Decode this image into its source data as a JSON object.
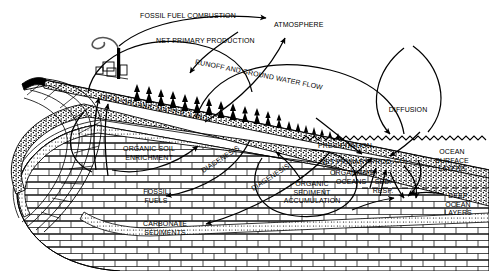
{
  "diagram": {
    "type": "schematic-cross-section",
    "background_color": "#ffffff",
    "ink_color": "#000000"
  },
  "labels": {
    "fossil_fuel_combustion": "FOSSIL FUEL COMBUSTION",
    "atmosphere": "ATMOSPHERE",
    "net_primary_production": "NET PRIMARY PRODUCTION",
    "runoff": "RUNOFF AND GROUND WATER FLOW",
    "dead_organic_matter_land": "DEAD ORGANIC MATTER, LAND",
    "organic_soil_enrichment": "ORGANIC SOIL\nENRICHMENT",
    "fossil_fuels": "FOSSIL\nFUELS",
    "carbonate_sediments": "CARBONATE\nSEDIMENTS",
    "diagenesis_1": "DIAGENESIS",
    "diagenesis_2": "DIAGENESIS",
    "diffusion": "DIFFUSION",
    "precipitation": "PRECIPITATION",
    "net_primary_prod_ocean": "NET PRIMARY PROD.",
    "organisms": "ORGANISMS",
    "oceans": "OCEANS",
    "co2": "CO",
    "co2_sub": "2",
    "sed_resp": "SED.\nRESP.",
    "organic_sediment_accumulation": "ORGANIC\nSEDIMENT\nACCUMULATION",
    "ocean_surface_layers": "OCEAN\nSURFACE\nLAYERS",
    "deep_ocean_layers": "DEEP\nOCEAN\nLAYERS"
  }
}
